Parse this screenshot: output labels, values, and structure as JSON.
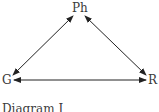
{
  "diagram": {
    "nodes": [
      {
        "id": "ph",
        "label": "Ph"
      },
      {
        "id": "g",
        "label": "G"
      },
      {
        "id": "r",
        "label": "R"
      }
    ],
    "edges": [
      {
        "from": "ph",
        "to": "g",
        "type": "bidirectional"
      },
      {
        "from": "ph",
        "to": "r",
        "type": "bidirectional"
      },
      {
        "from": "g",
        "to": "r",
        "type": "bidirectional"
      }
    ],
    "caption": "Diagram I"
  }
}
